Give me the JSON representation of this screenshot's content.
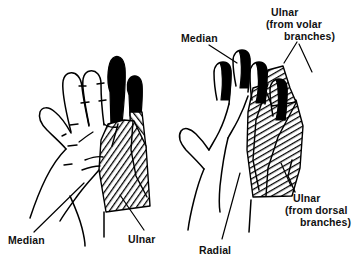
{
  "figure": {
    "view_left": "palmar",
    "view_right": "dorsal",
    "background_color": "#ffffff",
    "ink_color": "#000000",
    "shading": {
      "hatched_pattern": "diagonal-hatch",
      "solid_pattern": "solid-black"
    }
  },
  "labels": {
    "left_median": "Median",
    "left_ulnar": "Ulnar",
    "right_median": "Median",
    "right_ulnar_volar_line1": "Ulnar",
    "right_ulnar_volar_line2": "(from volar",
    "right_ulnar_volar_line3": "branches)",
    "right_ulnar_dorsal_line1": "Ulnar",
    "right_ulnar_dorsal_line2": "(from  dorsal",
    "right_ulnar_dorsal_line3": "branches)",
    "right_radial": "Radial"
  }
}
